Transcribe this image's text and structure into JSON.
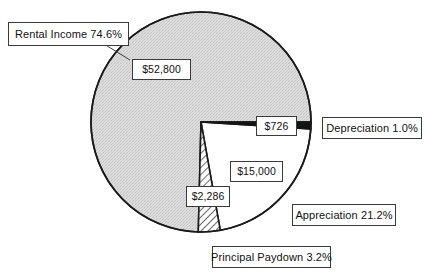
{
  "chart_data": {
    "type": "pie",
    "title": "",
    "subtitle": "",
    "xlabel": "",
    "ylabel": "",
    "legend_position": "callouts",
    "grid": false,
    "start_angle_deg": 0,
    "direction": "clockwise",
    "center": {
      "x": 201,
      "y": 122
    },
    "radius": 110,
    "categories": [
      "Depreciation",
      "Appreciation",
      "Principal Paydown",
      "Rental Income"
    ],
    "values": [
      726,
      15000,
      2286,
      52800
    ],
    "percentages": [
      1.0,
      21.2,
      3.2,
      74.6
    ],
    "value_labels": [
      "$726",
      "$15,000",
      "$2,286",
      "$52,800"
    ],
    "category_labels": [
      "Depreciation 1.0%",
      "Appreciation 21.2%",
      "Principal Paydown 3.2%",
      "Rental Income 74.6%"
    ],
    "slices": [
      {
        "name": "depreciation",
        "category_label": "Depreciation 1.0%",
        "value_label": "$726",
        "value": 726,
        "percent": 1.0,
        "fill": "#141414",
        "fill_style": "solid-black",
        "start_deg": 0,
        "end_deg": 3.6
      },
      {
        "name": "appreciation",
        "category_label": "Appreciation 21.2%",
        "value_label": "$15,000",
        "value": 15000,
        "percent": 21.2,
        "fill": "#ffffff",
        "fill_style": "solid-white",
        "start_deg": 3.6,
        "end_deg": 79.9
      },
      {
        "name": "principal-paydown",
        "category_label": "Principal Paydown 3.2%",
        "value_label": "$2,286",
        "value": 2286,
        "percent": 3.2,
        "fill": "#ffffff",
        "fill_style": "diagonal-hatch",
        "start_deg": 79.9,
        "end_deg": 91.4
      },
      {
        "name": "rental-income",
        "category_label": "Rental Income 74.6%",
        "value_label": "$52,800",
        "value": 52800,
        "percent": 74.6,
        "fill": "#d9d9d9",
        "fill_style": "light-gray-stipple",
        "start_deg": 91.4,
        "end_deg": 360
      }
    ],
    "colors": {
      "outline": "#1a1a1a",
      "background": "#ffffff",
      "rental_income": "#d9d9d9",
      "depreciation": "#141414",
      "appreciation": "#ffffff",
      "principal_paydown": "#ffffff",
      "label_border": "#3a3a3a",
      "label_text": "#111111"
    }
  },
  "callouts": {
    "rental_income_label": "Rental Income 74.6%",
    "rental_income_value": "$52,800",
    "depreciation_value": "$726",
    "depreciation_label": "Depreciation 1.0%",
    "appreciation_value": "$15,000",
    "appreciation_label": "Appreciation 21.2%",
    "principal_value": "$2,286",
    "principal_label": "Principal Paydown 3.2%"
  }
}
